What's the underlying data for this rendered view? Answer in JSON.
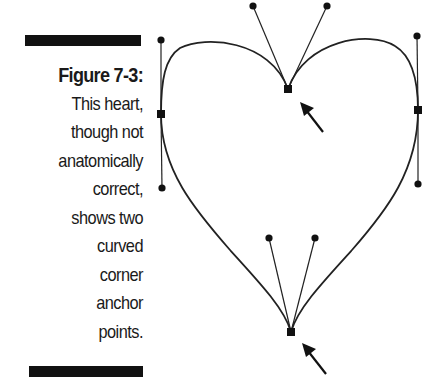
{
  "caption": {
    "title": "Figure 7-3:",
    "lines": [
      "This heart,",
      "though not",
      "anatomically",
      "correct,",
      "shows two",
      "curved",
      "corner",
      "anchor",
      "points."
    ]
  },
  "diagram": {
    "anchor_points": [
      {
        "name": "top-corner",
        "type": "curved-corner",
        "x": 288,
        "y": 89
      },
      {
        "name": "left",
        "type": "smooth",
        "x": 161,
        "y": 114
      },
      {
        "name": "right",
        "type": "smooth",
        "x": 418,
        "y": 110
      },
      {
        "name": "bottom-corner",
        "type": "curved-corner",
        "x": 291,
        "y": 332
      }
    ],
    "arrows": [
      "pointer-to-top-corner",
      "pointer-to-bottom-corner"
    ],
    "colors": {
      "ink": "#1a1a1a",
      "background": "#ffffff"
    }
  }
}
